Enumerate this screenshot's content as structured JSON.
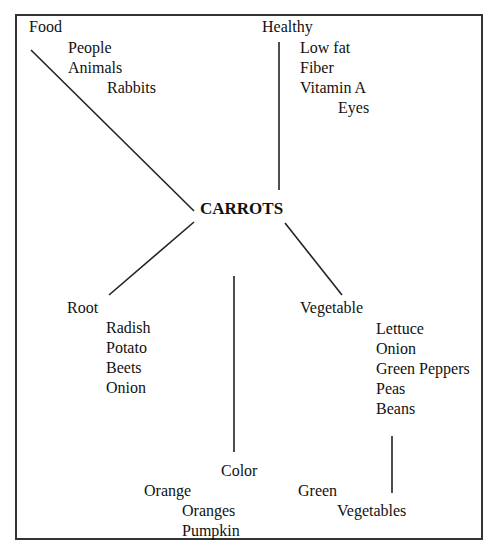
{
  "center": "CARROTS",
  "branches": {
    "food": {
      "label": "Food",
      "items": [
        "People",
        "Animals",
        "Rabbits"
      ]
    },
    "healthy": {
      "label": "Healthy",
      "items": [
        "Low fat",
        "Fiber",
        "Vitamin A",
        "Eyes"
      ]
    },
    "root": {
      "label": "Root",
      "items": [
        "Radish",
        "Potato",
        "Beets",
        "Onion"
      ]
    },
    "vegetable": {
      "label": "Vegetable",
      "items": [
        "Lettuce",
        "Onion",
        "Green Peppers",
        "Peas",
        "Beans"
      ]
    },
    "color": {
      "label": "Color",
      "items": [
        "Orange",
        "Oranges",
        "Pumpkin"
      ]
    },
    "green": {
      "label": "Green",
      "items": [
        "Vegetables"
      ]
    }
  }
}
